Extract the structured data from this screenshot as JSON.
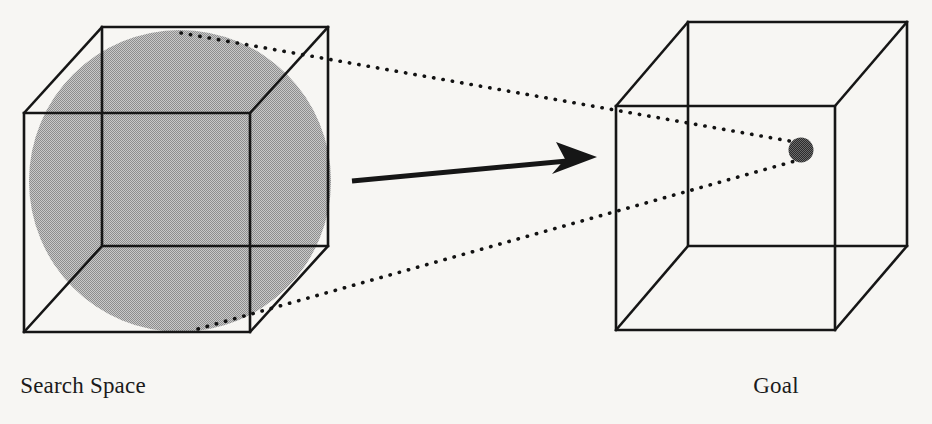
{
  "figure": {
    "background_color": "#f7f6f3",
    "width": 932,
    "height": 424
  },
  "labels": {
    "search_space": "Search Space",
    "goal": "Goal"
  },
  "colors": {
    "line": "#161616",
    "sphere_fill": "#a9a9a9",
    "goal_point_fill": "#474747",
    "background": "#f7f6f3"
  },
  "shapes": {
    "search_space_cube": {
      "name": "Search Space Cube",
      "front_face": {
        "left": 24,
        "top": 113,
        "right": 250,
        "bottom": 332
      },
      "depth_offset_x": 78,
      "depth_offset_y": -86
    },
    "search_space_sphere": {
      "name": "Search Space Sphere",
      "center_x": 180,
      "center_y": 181,
      "radius": 151,
      "fill": "#a9a9a9"
    },
    "goal_cube": {
      "name": "Goal Cube",
      "front_face": {
        "left": 616,
        "top": 106,
        "right": 835,
        "bottom": 330
      },
      "depth_offset_x": 72,
      "depth_offset_y": -84
    },
    "goal_point": {
      "name": "Goal Point",
      "center_x": 801,
      "center_y": 150,
      "radius": 12,
      "fill": "#474747"
    },
    "arrow": {
      "name": "Transition Arrow",
      "start_x": 352,
      "start_y": 180,
      "end_x": 596,
      "end_y": 157
    },
    "ray_upper": {
      "name": "Upper Projection Ray",
      "start_x": 181,
      "start_y": 33,
      "end_x": 795,
      "end_y": 142
    },
    "ray_lower": {
      "name": "Lower Projection Ray",
      "start_x": 198,
      "start_y": 329,
      "end_x": 795,
      "end_y": 160
    }
  },
  "annotations": {
    "description": "A large shaded sphere inscribed in a wireframe cube labeled Search Space maps via an arrow and two dotted projection rays onto a small dark point inside a second wireframe cube labeled Goal."
  }
}
